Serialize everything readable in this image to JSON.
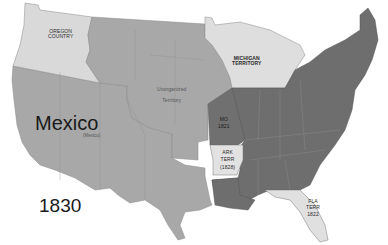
{
  "map": {
    "title_year": "1830",
    "colors": {
      "background": "#ffffff",
      "light_territory": "#d9d9d9",
      "medium_region": "#a8a8a8",
      "dark_states": "#6e6e6e",
      "boundary_line": "#8a8a8a",
      "text": "#222222"
    },
    "labels": {
      "oregon": [
        "OREGON",
        "COUNTRY"
      ],
      "unorganized": [
        "Unorganized",
        "Territory"
      ],
      "michigan": [
        "MICHIGAN",
        "TERRITORY"
      ],
      "mexico_big": "Mexico",
      "mexico_small": "(Mexico)",
      "missouri": [
        "MO",
        "1821"
      ],
      "arkansas": [
        "ARK",
        "TERR",
        "(1828)"
      ],
      "florida": [
        "FLA",
        "TERR",
        "1822"
      ]
    },
    "regions": [
      {
        "name": "Oregon Country",
        "shade": "light"
      },
      {
        "name": "Unorganized Territory",
        "shade": "medium"
      },
      {
        "name": "Mexico",
        "shade": "medium"
      },
      {
        "name": "Michigan Territory",
        "shade": "light"
      },
      {
        "name": "Arkansas Territory",
        "shade": "light"
      },
      {
        "name": "Florida Territory",
        "shade": "light"
      },
      {
        "name": "States",
        "shade": "dark"
      }
    ]
  }
}
